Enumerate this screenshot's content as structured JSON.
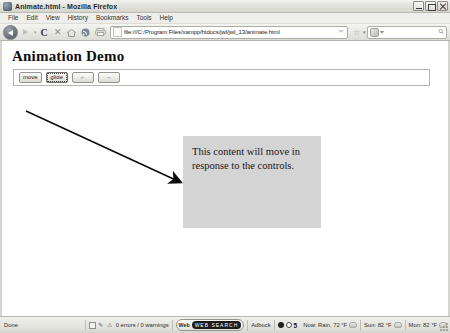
{
  "window": {
    "title": "Animate.html - Mozilla Firefox",
    "app_icon": "firefox-icon",
    "minimize_label": "Minimize",
    "maximize_label": "Maximize",
    "close_label": "Close"
  },
  "menubar": {
    "items": [
      {
        "label": "File",
        "name": "menu-file"
      },
      {
        "label": "Edit",
        "name": "menu-edit"
      },
      {
        "label": "View",
        "name": "menu-view"
      },
      {
        "label": "History",
        "name": "menu-history"
      },
      {
        "label": "Bookmarks",
        "name": "menu-bookmarks"
      },
      {
        "label": "Tools",
        "name": "menu-tools"
      },
      {
        "label": "Help",
        "name": "menu-help"
      }
    ]
  },
  "toolbar": {
    "back_label": "Back",
    "forward_label": "Forward",
    "reload_label": "C",
    "stop_label": "✕",
    "home_label": "Home",
    "feed_label": "Feed",
    "print_label": "Print",
    "url_value": "file:///C:/Program Files/xampp/htdocs/jwl/jwl_13/animate.html",
    "url_placeholder": "Go to a Web Site",
    "bookmark_star": "☆",
    "star_caret": "▾",
    "search_placeholder": "Google",
    "search_value": "",
    "search_engine_label": "G",
    "search_magnifier": "⚲"
  },
  "page": {
    "heading": "Animation Demo",
    "controls": [
      {
        "label": "move",
        "name": "move-button",
        "focused": false
      },
      {
        "label": "glide",
        "name": "glide-button",
        "focused": true
      },
      {
        "label": "←",
        "name": "left-arrow-button",
        "focused": false
      },
      {
        "label": "→",
        "name": "right-arrow-button",
        "focused": false
      }
    ],
    "content_box": {
      "text": "This content will move in response to the controls.",
      "background": "#d4d4d4"
    },
    "annotation": {
      "type": "arrow",
      "color": "#0a0a0a",
      "from": "upper-left",
      "to": "content-box"
    }
  },
  "statusbar": {
    "status_text": "Done",
    "error_summary": "0 errors / 0 warnings",
    "web_label": "Web",
    "web_badge": "WEB SEARCH",
    "adblock_label": "Adbock",
    "counter_value": "5",
    "weather_now": "Now: Rain, 72 °F",
    "weather_sun": "Sun: 82 °F",
    "weather_mon": "Mon: 82 °F"
  }
}
